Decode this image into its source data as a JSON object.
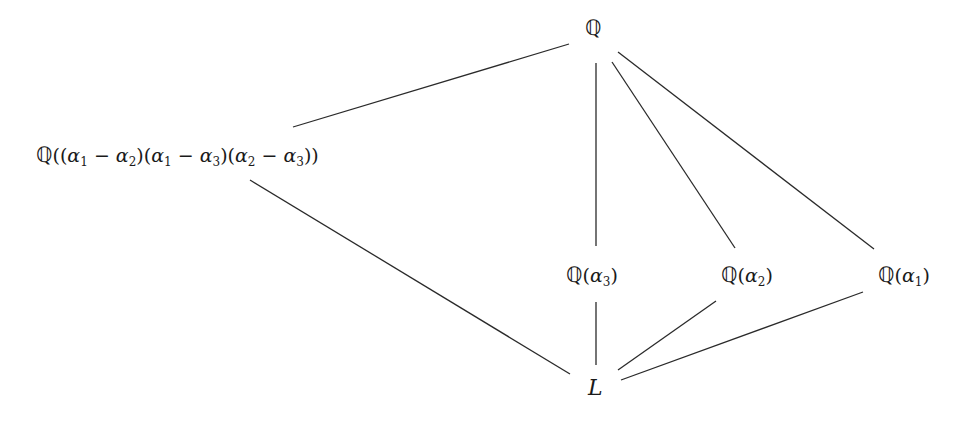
{
  "diagram": {
    "type": "field-extension-lattice",
    "nodes": [
      {
        "id": "Q",
        "label": "ℚ",
        "x": 596,
        "y": 28
      },
      {
        "id": "Qdisc",
        "label": "ℚ((α1 − α2)(α1 − α3)(α2 − α3))",
        "x": 197,
        "y": 155
      },
      {
        "id": "Qa3",
        "label": "ℚ(α3)",
        "x": 596,
        "y": 275
      },
      {
        "id": "Qa2",
        "label": "ℚ(α2)",
        "x": 749,
        "y": 275
      },
      {
        "id": "Qa1",
        "label": "ℚ(α1)",
        "x": 906,
        "y": 275
      },
      {
        "id": "L",
        "label": "L",
        "x": 596,
        "y": 389
      }
    ],
    "edges": [
      {
        "from": "Q",
        "to": "Qdisc",
        "x1": 569,
        "y1": 44,
        "x2": 293,
        "y2": 127
      },
      {
        "from": "Q",
        "to": "Qa3",
        "x1": 596,
        "y1": 63,
        "x2": 596,
        "y2": 246
      },
      {
        "from": "Q",
        "to": "Qa2",
        "x1": 612,
        "y1": 62,
        "x2": 735,
        "y2": 248
      },
      {
        "from": "Q",
        "to": "Qa1",
        "x1": 618,
        "y1": 52,
        "x2": 874,
        "y2": 249
      },
      {
        "from": "Qdisc",
        "to": "L",
        "x1": 250,
        "y1": 180,
        "x2": 570,
        "y2": 374
      },
      {
        "from": "Qa3",
        "to": "L",
        "x1": 596,
        "y1": 302,
        "x2": 596,
        "y2": 365
      },
      {
        "from": "Qa2",
        "to": "L",
        "x1": 716,
        "y1": 301,
        "x2": 618,
        "y2": 370
      },
      {
        "from": "Qa1",
        "to": "L",
        "x1": 863,
        "y1": 292,
        "x2": 621,
        "y2": 380
      }
    ],
    "line_color": "#2a2a2a",
    "text": {
      "top": {
        "bb": "ℚ"
      },
      "disc": {
        "bb": "ℚ",
        "p1": "((",
        "a": "α",
        "s1": "1",
        "m1": " − ",
        "s2": "2",
        "p2": ")(",
        "s3": "1",
        "m2": " − ",
        "s4": "3",
        "p3": ")(",
        "s5": "2",
        "m3": " − ",
        "s6": "3",
        "p4": "))"
      },
      "a3": {
        "bb": "ℚ",
        "open": "(",
        "a": "α",
        "sub": "3",
        "close": ")"
      },
      "a2": {
        "bb": "ℚ",
        "open": "(",
        "a": "α",
        "sub": "2",
        "close": ")"
      },
      "a1": {
        "bb": "ℚ",
        "open": "(",
        "a": "α",
        "sub": "1",
        "close": ")"
      },
      "bottom": {
        "L": "L"
      }
    }
  }
}
